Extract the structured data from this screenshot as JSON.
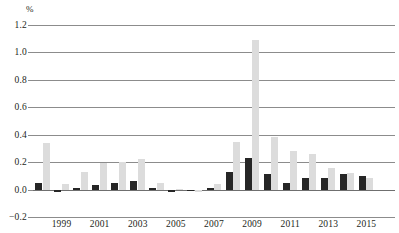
{
  "chart_data": {
    "type": "bar",
    "title": "",
    "subtitle": "",
    "xlabel": "",
    "ylabel": "%",
    "unit_label": "%",
    "ylim": [
      -0.2,
      1.2
    ],
    "ytick_step": 0.2,
    "yticks": [
      1.2,
      1.0,
      0.8,
      0.6,
      0.4,
      0.2,
      0.0,
      -0.2
    ],
    "ytick_labels": [
      "1.2",
      "1.0",
      "0.8",
      "0.6",
      "0.4",
      "0.2",
      "0.0",
      "−0.2"
    ],
    "grid": true,
    "grid_orientation": "horizontal",
    "legend": null,
    "legend_position": "none",
    "annotations": [],
    "categories": [
      1998,
      1999,
      2000,
      2001,
      2002,
      2003,
      2004,
      2005,
      2006,
      2007,
      2008,
      2009,
      2010,
      2011,
      2012,
      2013,
      2014,
      2015,
      2016
    ],
    "xtick_labels": [
      "1999",
      "2001",
      "2003",
      "2005",
      "2007",
      "2009",
      "2011",
      "2013",
      "2015"
    ],
    "xticks": [
      1999,
      2001,
      2003,
      2005,
      2007,
      2009,
      2011,
      2013,
      2015
    ],
    "series": [
      {
        "name": "dark",
        "color": "#262626",
        "values": [
          0.045,
          -0.015,
          0.015,
          0.03,
          0.05,
          0.065,
          0.01,
          -0.02,
          -0.01,
          0.015,
          0.125,
          0.23,
          0.11,
          0.05,
          0.085,
          0.085,
          0.115,
          0.1,
          null
        ]
      },
      {
        "name": "light",
        "color": "#dcdcdc",
        "values": [
          0.34,
          0.04,
          0.13,
          0.195,
          0.2,
          0.22,
          0.05,
          0.005,
          -0.02,
          0.04,
          0.35,
          1.09,
          0.385,
          0.28,
          0.26,
          0.155,
          0.12,
          0.085,
          null
        ]
      }
    ]
  }
}
